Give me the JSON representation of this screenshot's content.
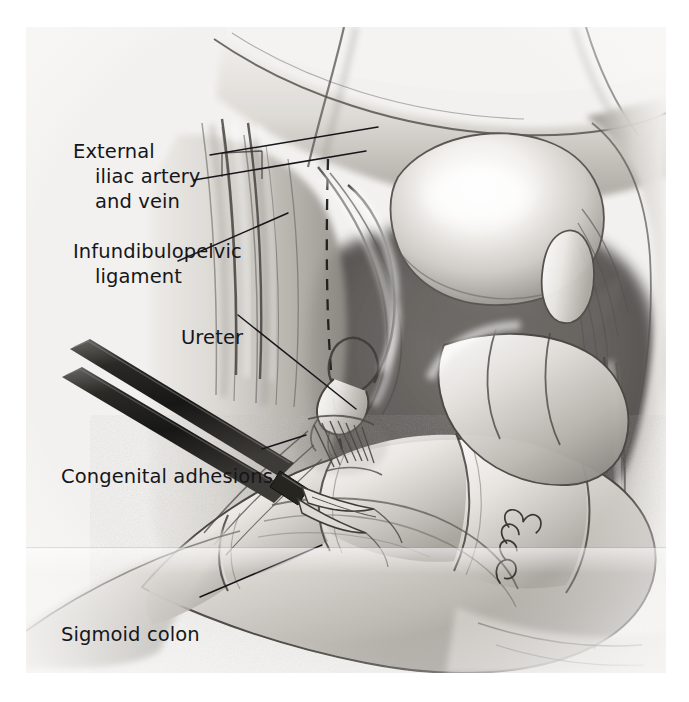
{
  "figure": {
    "kind": "medical-illustration",
    "medium": "graphite pencil drawing on textured paper",
    "background_color": "#f3f2f0",
    "ink_color": "#16161a",
    "plate_bounds": {
      "left": 26,
      "top": 27,
      "width": 640,
      "height": 646
    }
  },
  "labels": [
    {
      "id": "external-iliac-artery-and-vein",
      "lines": [
        "External",
        "iliac artery",
        "and vein"
      ],
      "x": 47,
      "y": 112,
      "leaders": [
        {
          "from": [
            210,
            155
          ],
          "to": [
            345,
            126
          ]
        },
        {
          "from": [
            196,
            180
          ],
          "to": [
            330,
            150
          ]
        }
      ]
    },
    {
      "id": "infundibulopelvic-ligament",
      "lines": [
        "Infundibulopelvic",
        "ligament"
      ],
      "x": 47,
      "y": 212,
      "leaders": [
        {
          "from": [
            178,
            260
          ],
          "to": [
            268,
            210
          ]
        }
      ]
    },
    {
      "id": "ureter",
      "lines": [
        "Ureter"
      ],
      "x": 155,
      "y": 298,
      "leaders": [
        {
          "from": [
            238,
            314
          ],
          "to": [
            330,
            408
          ]
        }
      ]
    },
    {
      "id": "congenital-adhesions",
      "lines": [
        "Congenital adhesions"
      ],
      "x": 35,
      "y": 437,
      "leaders": [
        {
          "from": [
            262,
            449
          ],
          "to": [
            300,
            438
          ]
        }
      ]
    },
    {
      "id": "sigmoid-colon",
      "lines": [
        "Sigmoid colon"
      ],
      "x": 35,
      "y": 595,
      "leaders": [
        {
          "from": [
            200,
            597
          ],
          "to": [
            320,
            546
          ]
        }
      ]
    }
  ],
  "annotations": {
    "dashed_incision_line": "dashed peritoneal incision line along the pelvic sidewall",
    "signature": "artist monogram, lower right of plate"
  },
  "anatomy_elements": [
    "uterine fundus",
    "left fallopian tube",
    "left ovary",
    "infundibulopelvic ligament",
    "ureter",
    "external iliac artery and vein",
    "pelvic sidewall peritoneum",
    "sigmoid colon",
    "congenital adhesions",
    "laparoscopic dissecting instrument"
  ]
}
